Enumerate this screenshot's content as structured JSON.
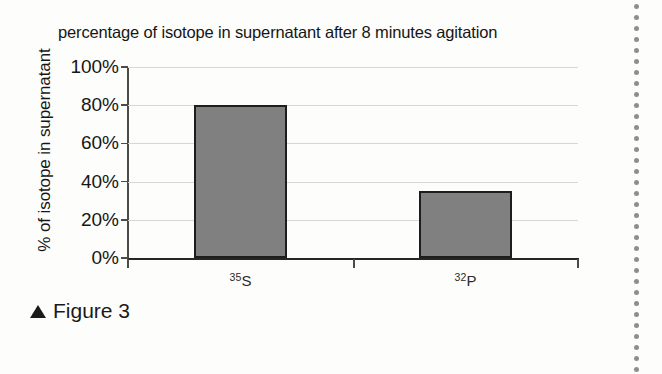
{
  "figure": {
    "caption_marker": "triangle-up-icon",
    "caption_text": "Figure 3"
  },
  "chart_data": {
    "type": "bar",
    "title": "percentage of isotope in supernatant after 8 minutes agitation",
    "xlabel": "",
    "ylabel": "% of isotope in supernatant",
    "categories": [
      "35S",
      "32P"
    ],
    "category_labels": [
      {
        "superscript": "35",
        "base": "S"
      },
      {
        "superscript": "32",
        "base": "P"
      }
    ],
    "values": [
      80,
      35
    ],
    "value_labels": [
      "80%",
      "35%"
    ],
    "ylim": [
      0,
      100
    ],
    "y_ticks": [
      0,
      20,
      40,
      60,
      80,
      100
    ],
    "y_tick_labels": [
      "0%",
      "20%",
      "40%",
      "60%",
      "80%",
      "100%"
    ],
    "grid": true,
    "grid_axis": "y",
    "legend": false,
    "legend_position": "none",
    "bar_fill_color": "#808080",
    "bar_border_color": "#1d1d1d",
    "gridline_color": "#d7d7d7",
    "axis_color": "#262626",
    "background_color": "#fdfdfb"
  },
  "page_edge": {
    "marker_type": "perforation-dots",
    "dot_color": "#8e8e8e",
    "dot_count": 34
  }
}
